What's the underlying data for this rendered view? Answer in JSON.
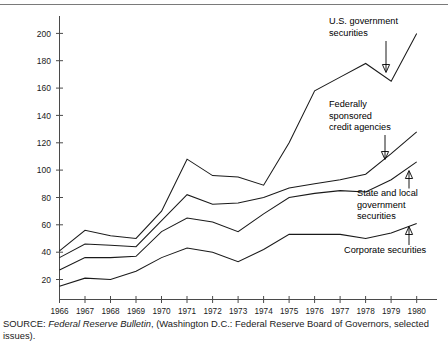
{
  "chart_data": {
    "type": "line",
    "title": "",
    "xlabel": "",
    "ylabel": "",
    "xlim": [
      1966,
      1980
    ],
    "ylim": [
      0,
      210
    ],
    "yticks": [
      20,
      40,
      60,
      80,
      100,
      120,
      140,
      160,
      180,
      200
    ],
    "grid": false,
    "legend_position": "inline-annotations",
    "x": [
      1966,
      1967,
      1968,
      1969,
      1970,
      1971,
      1972,
      1973,
      1974,
      1975,
      1976,
      1977,
      1978,
      1979,
      1980
    ],
    "categories": [
      "1966",
      "1967",
      "1968",
      "1969",
      "1970",
      "1971",
      "1972",
      "1973",
      "1974",
      "1975",
      "1976",
      "1977",
      "1978",
      "1979",
      "1980"
    ],
    "series": [
      {
        "name": "U.S. government securities",
        "values": [
          41,
          56,
          52,
          50,
          70,
          108,
          96,
          95,
          89,
          120,
          158,
          168,
          178,
          165,
          200
        ]
      },
      {
        "name": "Federally sponsored credit agencies",
        "values": [
          36,
          46,
          45,
          44,
          63,
          82,
          75,
          76,
          80,
          87,
          90,
          93,
          97,
          112,
          128
        ]
      },
      {
        "name": "State and local government securities",
        "values": [
          27,
          36,
          36,
          37,
          55,
          65,
          62,
          55,
          68,
          80,
          83,
          85,
          84,
          93,
          106
        ]
      },
      {
        "name": "Corporate securities",
        "values": [
          15,
          21,
          20,
          26,
          36,
          43,
          40,
          33,
          42,
          53,
          53,
          53,
          50,
          54,
          61
        ]
      }
    ],
    "annotations": [
      {
        "id": "us-government-securities",
        "lines": [
          "U.S. government",
          "securities"
        ]
      },
      {
        "id": "federally-sponsored-credit-agencies",
        "lines": [
          "Federally",
          "sponsored",
          "credit agencies"
        ]
      },
      {
        "id": "state-and-local-government-securities",
        "lines": [
          "State and local",
          "government",
          "securities"
        ]
      },
      {
        "id": "corporate-securities",
        "lines": [
          "Corporate securities"
        ]
      }
    ]
  },
  "axes": {
    "y_tick_labels": [
      "200",
      "180",
      "160",
      "140",
      "120",
      "100",
      "80",
      "60",
      "40",
      "20"
    ],
    "x_tick_labels": [
      "1966",
      "1967",
      "1968",
      "1969",
      "1970",
      "1971",
      "1972",
      "1973",
      "1974",
      "1975",
      "1976",
      "1977",
      "1978",
      "1979",
      "1980"
    ]
  },
  "annotation_text": {
    "us_gov_line1": "U.S. government",
    "us_gov_line2": "securities",
    "fed_line1": "Federally",
    "fed_line2": "sponsored",
    "fed_line3": "credit agencies",
    "state_line1": "State and local",
    "state_line2": "government",
    "state_line3": "securities",
    "corp_line1": "Corporate securities"
  },
  "source": {
    "prefix": "SOURCE: ",
    "italic_title": "Federal Reserve Bulletin",
    "suffix": ", (Washington D.C.: Federal Reserve Board of Governors, selected issues)."
  },
  "colors": {
    "line": "#1a1a1a",
    "axis": "#4a4a4a",
    "background": "#ffffff",
    "text": "#1a1a1a"
  }
}
